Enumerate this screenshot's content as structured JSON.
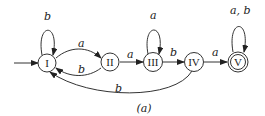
{
  "diagram": {
    "caption": "(a)",
    "states": [
      {
        "id": "I",
        "label": "I",
        "initial": true,
        "accepting": false
      },
      {
        "id": "II",
        "label": "II",
        "initial": false,
        "accepting": false
      },
      {
        "id": "III",
        "label": "III",
        "initial": false,
        "accepting": false
      },
      {
        "id": "IV",
        "label": "IV",
        "initial": false,
        "accepting": false
      },
      {
        "id": "V",
        "label": "V",
        "initial": false,
        "accepting": true
      }
    ],
    "transitions": [
      {
        "from": "I",
        "to": "I",
        "label": "b"
      },
      {
        "from": "I",
        "to": "II",
        "label": "a"
      },
      {
        "from": "II",
        "to": "I",
        "label": "b"
      },
      {
        "from": "II",
        "to": "III",
        "label": "a"
      },
      {
        "from": "III",
        "to": "III",
        "label": "a"
      },
      {
        "from": "III",
        "to": "IV",
        "label": "b"
      },
      {
        "from": "IV",
        "to": "V",
        "label": "a"
      },
      {
        "from": "IV",
        "to": "I",
        "label": "b"
      },
      {
        "from": "V",
        "to": "V",
        "label": "a, b"
      }
    ]
  }
}
